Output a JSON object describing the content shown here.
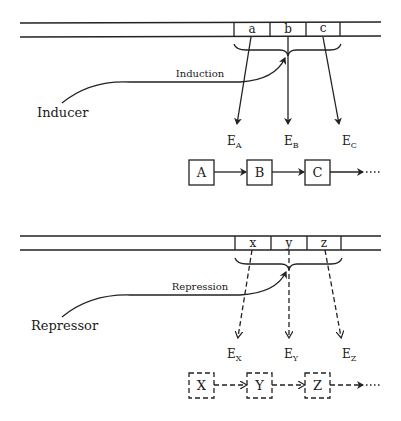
{
  "induction_panel": {
    "genes": [
      "a",
      "b",
      "c"
    ],
    "effector_label": "Inducer",
    "process_label": "Induction",
    "enzymes": [
      {
        "base": "E",
        "sub": "A"
      },
      {
        "base": "E",
        "sub": "B"
      },
      {
        "base": "E",
        "sub": "C"
      }
    ],
    "pathway": [
      "A",
      "B",
      "C"
    ],
    "line_style": "solid"
  },
  "repression_panel": {
    "genes": [
      "x",
      "y",
      "z"
    ],
    "effector_label": "Repressor",
    "process_label": "Repression",
    "enzymes": [
      {
        "base": "E",
        "sub": "X"
      },
      {
        "base": "E",
        "sub": "Y"
      },
      {
        "base": "E",
        "sub": "Z"
      }
    ],
    "pathway": [
      "X",
      "Y",
      "Z"
    ],
    "line_style": "dashed"
  }
}
